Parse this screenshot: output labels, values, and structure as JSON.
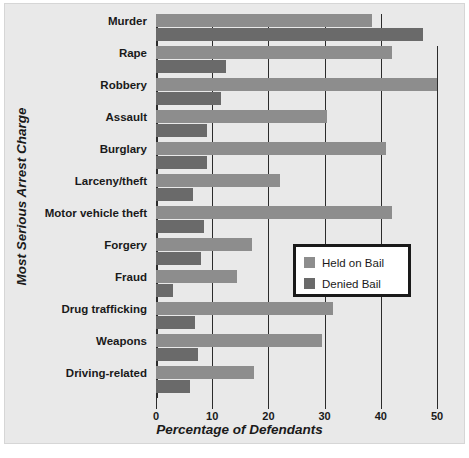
{
  "chart_data": {
    "type": "bar",
    "orientation": "horizontal",
    "title": "",
    "xlabel": "Percentage of Defendants",
    "ylabel": "Most Serious Arrest Charge",
    "xlim": [
      0,
      52
    ],
    "xticks": [
      0,
      10,
      20,
      30,
      40,
      50
    ],
    "xticklabels": [
      "0",
      "10",
      "20",
      "30",
      "40",
      "50"
    ],
    "grid": "vertical",
    "legend_position": "center-right",
    "categories": [
      "Murder",
      "Rape",
      "Robbery",
      "Assault",
      "Burglary",
      "Larceny/theft",
      "Motor vehicle theft",
      "Forgery",
      "Fraud",
      "Drug trafficking",
      "Weapons",
      "Driving-related"
    ],
    "series": [
      {
        "name": "Held on Bail",
        "color": "#8d8d8d",
        "values": [
          38.5,
          42.0,
          50.0,
          30.5,
          41.0,
          22.0,
          42.0,
          17.0,
          14.5,
          31.5,
          29.5,
          17.5
        ]
      },
      {
        "name": "Denied Bail",
        "color": "#6a6a6a",
        "values": [
          47.5,
          12.5,
          11.5,
          9.0,
          9.0,
          6.5,
          8.5,
          8.0,
          3.0,
          7.0,
          7.5,
          6.0
        ]
      }
    ]
  },
  "legend": {
    "items": [
      {
        "label": "Held on Bail",
        "color": "#8d8d8d"
      },
      {
        "label": "Denied Bail",
        "color": "#6a6a6a"
      }
    ]
  },
  "colors": {
    "panel_background": "#e9e9e9",
    "page_background": "#ffffff",
    "axis": "#2b2b2b",
    "text": "#1a1a1a",
    "held_on_bail": "#8d8d8d",
    "denied_bail": "#6a6a6a"
  }
}
